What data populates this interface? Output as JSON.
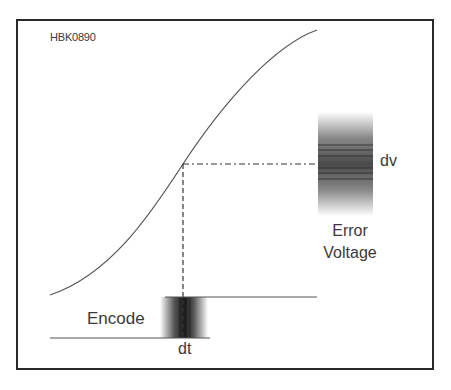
{
  "figure": {
    "id_label": "HBK0890",
    "curve_label": "",
    "error_band_label": "dv",
    "error_caption_line1": "Error",
    "error_caption_line2": "Voltage",
    "encode_label": "Encode",
    "time_band_label": "dt"
  },
  "colors": {
    "frame": "#2a2a2a",
    "curve": "#555555",
    "text": "#3a3a3a",
    "band_dark": "#333333"
  }
}
